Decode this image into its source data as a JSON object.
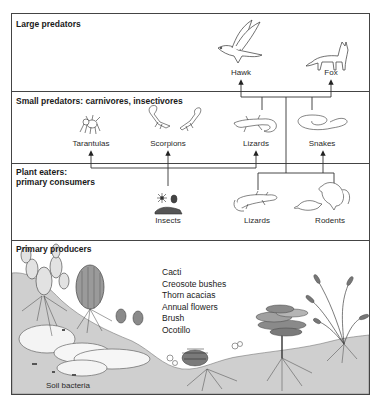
{
  "diagram": {
    "sections": [
      {
        "id": "large-predators",
        "title": "Large predators"
      },
      {
        "id": "small-predators",
        "title": "Small predators: carnivores, insectivores"
      },
      {
        "id": "plant-eaters",
        "title_line1": "Plant eaters:",
        "title_line2": "primary consumers"
      },
      {
        "id": "primary-producers",
        "title": "Primary producers"
      }
    ],
    "organisms": {
      "hawk": "Hawk",
      "fox": "Fox",
      "tarantulas": "Tarantulas",
      "scorpions": "Scorpions",
      "lizards_predator": "Lizards",
      "snakes": "Snakes",
      "insects": "Insects",
      "lizards_consumer": "Lizards",
      "rodents": "Rodents",
      "soil_bacteria": "Soil bacteria"
    },
    "producers_list": [
      "Cacti",
      "Creosote bushes",
      "Thorn acacias",
      "Annual flowers",
      "Brush",
      "Ocotillo"
    ],
    "edges": [
      {
        "from": "Lizards (small predator)",
        "to": "Hawk"
      },
      {
        "from": "Lizards (small predator)",
        "to": "Fox"
      },
      {
        "from": "Snakes",
        "to": "Hawk"
      },
      {
        "from": "Snakes",
        "to": "Fox"
      },
      {
        "from": "Lizards (plant eater)",
        "to": "Hawk"
      },
      {
        "from": "Rodents",
        "to": "Fox"
      },
      {
        "from": "Lizards (plant eater)",
        "to": "Snakes"
      },
      {
        "from": "Rodents",
        "to": "Snakes"
      },
      {
        "from": "Insects",
        "to": "Tarantulas"
      },
      {
        "from": "Insects",
        "to": "Scorpions"
      },
      {
        "from": "Insects",
        "to": "Lizards (small predator)"
      }
    ],
    "colors": {
      "line": "#333333",
      "ground": "#cfcfcf",
      "rock": "#f4f4f4",
      "plant_dark": "#8a8a8a",
      "plant_mid": "#a9a9a9"
    }
  }
}
